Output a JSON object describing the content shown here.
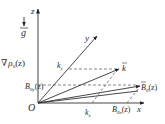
{
  "diagram": {
    "type": "vector-coordinate-diagram",
    "colors": {
      "line": "#333333",
      "background": "#ffffff"
    },
    "origin": {
      "label": "O"
    },
    "axes": {
      "z": {
        "label": "z"
      },
      "y": {
        "label": "y"
      },
      "x": {
        "label": "x"
      }
    },
    "gravity": {
      "label": "g",
      "arrow": "down-arrow-icon"
    },
    "density_gradient": {
      "label_nabla": "∇",
      "label_rho": "ρ",
      "label_sub": "0",
      "label_arg": "(z)"
    },
    "vectors": {
      "k": {
        "label": "k",
        "component_x": "k",
        "component_x_sub": "x",
        "component_y": "k",
        "component_y_sub": "y"
      },
      "B0": {
        "label": "B",
        "label_sub": "0",
        "label_arg": "(z)",
        "component_x": "B",
        "component_x_sub": "0x",
        "component_x_arg": "(z)",
        "component_y": "B",
        "component_y_sub": "0y",
        "component_y_arg": "(z)"
      }
    }
  }
}
